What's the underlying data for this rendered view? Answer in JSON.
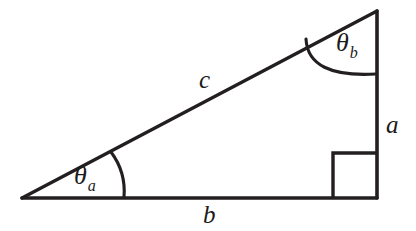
{
  "figure": {
    "name": "right-triangle-diagram",
    "background_color": "#ffffff",
    "stroke_color": "#231f20"
  },
  "geometry": {
    "vertices": {
      "left": {
        "x": 22,
        "y": 198
      },
      "right_bottom": {
        "x": 377,
        "y": 198
      },
      "apex": {
        "x": 377,
        "y": 11
      }
    },
    "right_angle_marker": {
      "x": 333,
      "y": 153,
      "size": 44
    },
    "angle_arc_a": {
      "start": {
        "x": 112,
        "y": 164
      },
      "end": {
        "x": 124,
        "y": 197
      }
    },
    "angle_arc_b": {
      "start": {
        "x": 311,
        "y": 42
      },
      "end": {
        "x": 376,
        "y": 73
      }
    }
  },
  "labels": {
    "hypotenuse": {
      "text": "c",
      "x": 199,
      "y": 67
    },
    "vertical_leg": {
      "text": "a",
      "x": 386,
      "y": 112
    },
    "horizontal_leg": {
      "text": "b",
      "x": 203,
      "y": 202
    },
    "angle_a": {
      "symbol": "θ",
      "subscript": "a",
      "x": 74,
      "y": 163
    },
    "angle_b": {
      "symbol": "θ",
      "subscript": "b",
      "x": 336,
      "y": 30
    }
  }
}
